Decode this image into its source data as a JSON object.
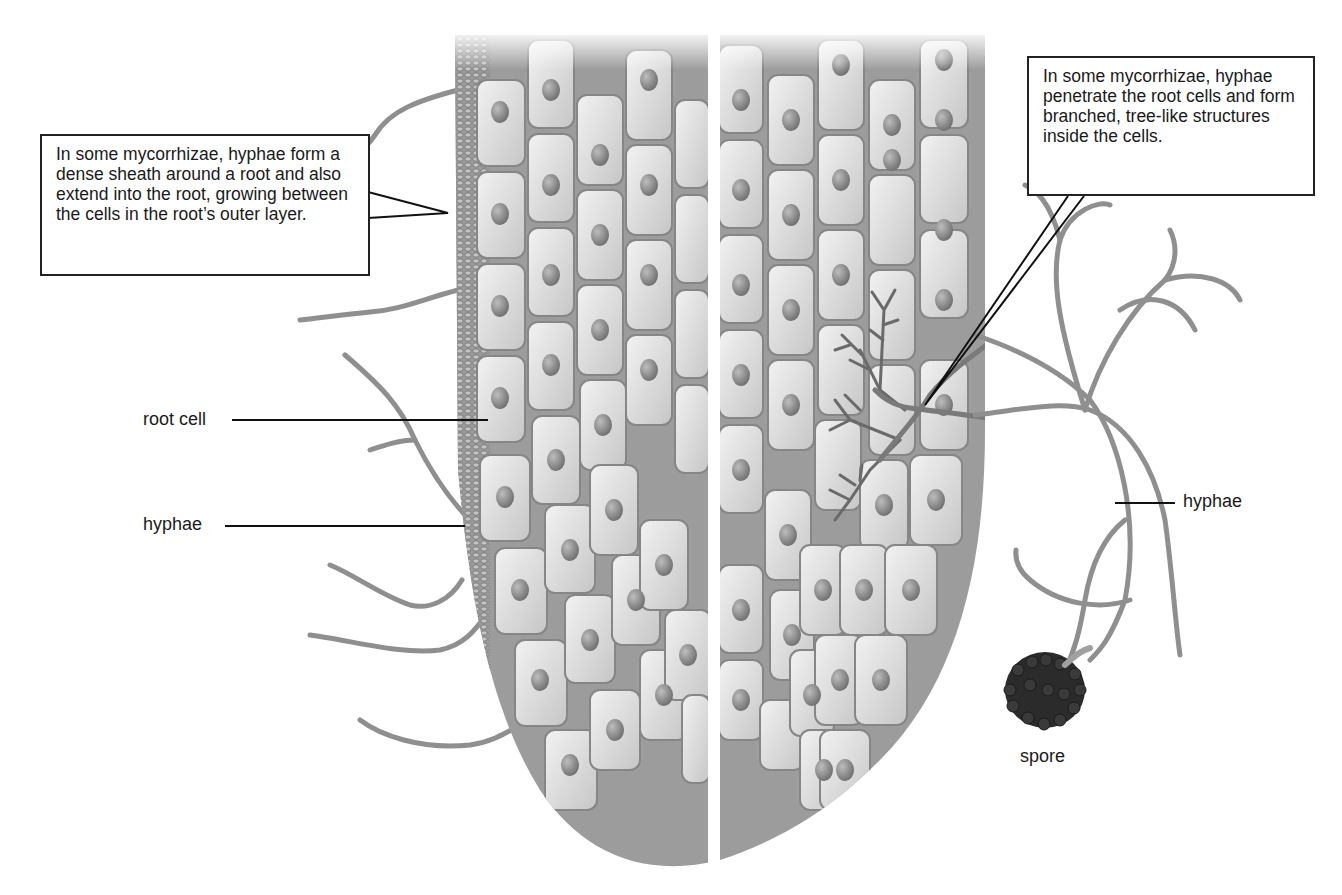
{
  "diagram": {
    "type": "biology-illustration",
    "callouts": {
      "left": "In some mycorrhizae, hyphae form a dense sheath around a root and also extend into the root, growing between the cells in the root’s outer layer.",
      "right": "In some mycorrhizae, hyphae penetrate the root cells and form branched, tree-like structures inside the cells."
    },
    "labels": {
      "root_cell": "root cell",
      "hyphae_left": "hyphae",
      "hyphae_right": "hyphae",
      "spore": "spore"
    },
    "colors": {
      "cell_fill": "#d9d9d9",
      "cell_stroke": "#8a8a8a",
      "nucleus": "#8c8c8c",
      "intercellular": "#a8a8a8",
      "sheath": "#8e8e8e",
      "hyphae": "#909090",
      "spore": "#2b2b2b",
      "leader_line": "#111111"
    }
  }
}
